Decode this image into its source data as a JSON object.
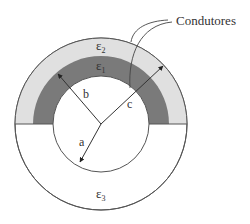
{
  "diagram": {
    "title_label": "Condutores",
    "regions": {
      "outer_layer": {
        "symbol": "ε",
        "subscript": "2",
        "color": "#e0e0e0"
      },
      "inner_layer": {
        "symbol": "ε",
        "subscript": "1",
        "color": "#7a7a7a"
      },
      "lower_region": {
        "symbol": "ε",
        "subscript": "3",
        "color": "#ffffff"
      }
    },
    "radii": {
      "a": "a",
      "b": "b",
      "c": "c"
    },
    "stroke_color": "#555555"
  }
}
